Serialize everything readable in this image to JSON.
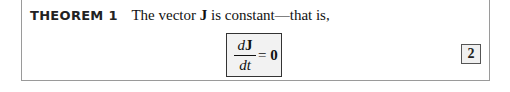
{
  "theorem": {
    "label": "THEOREM 1",
    "text_pre": "The vector ",
    "symbol": "J",
    "text_post": " is constant—that is,"
  },
  "equation": {
    "numerator_d": "d",
    "numerator_var": "J",
    "denominator": "dt",
    "equals": " = ",
    "rhs": "0"
  },
  "equation_number": "2"
}
